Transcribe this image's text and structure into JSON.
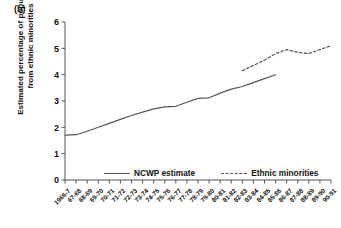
{
  "panel_label": "(b)",
  "legend": {
    "items": [
      {
        "label": "NCWP estimate",
        "style": "solid"
      },
      {
        "label": "Ethnic minorities",
        "style": "dashed"
      }
    ]
  },
  "chart_data": {
    "type": "line",
    "title": "",
    "panel": "(b)",
    "xlabel": "",
    "ylabel": "Estimated percentage of population from ethnic minorities",
    "ylabel_lines": [
      "Estimated percentage of population",
      "from ethnic minorities"
    ],
    "ylim": [
      0,
      6
    ],
    "yticks": [
      0,
      1,
      2,
      3,
      4,
      5,
      6
    ],
    "grid": false,
    "legend_position": "bottom-center",
    "line_color": "#555555",
    "categories": [
      "1966-7",
      "67-68",
      "68-69",
      "69-70",
      "70-71",
      "71-72",
      "72-73",
      "73-74",
      "74-75",
      "75-76",
      "76-77",
      "77-78",
      "78-79",
      "79-80",
      "80-81",
      "81-82",
      "82-83",
      "83-84",
      "84-85",
      "85-86",
      "86-87",
      "87-88",
      "88-89",
      "89-90",
      "90-91"
    ],
    "series": [
      {
        "name": "NCWP estimate",
        "style": "solid",
        "values": [
          1.7,
          1.72,
          1.85,
          2.0,
          2.15,
          2.3,
          2.45,
          2.58,
          2.7,
          2.78,
          2.8,
          2.95,
          3.1,
          3.12,
          3.3,
          3.45,
          3.55,
          3.7,
          3.85,
          4.0,
          null,
          null,
          null,
          null,
          null
        ]
      },
      {
        "name": "Ethnic minorities",
        "style": "dashed",
        "values": [
          null,
          null,
          null,
          null,
          null,
          null,
          null,
          null,
          null,
          null,
          null,
          null,
          null,
          null,
          null,
          null,
          4.15,
          4.35,
          4.55,
          4.8,
          4.95,
          4.85,
          4.8,
          4.95,
          5.1
        ]
      }
    ]
  }
}
